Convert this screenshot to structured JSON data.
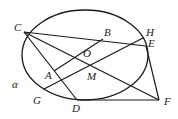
{
  "diagram": {
    "type": "geometry",
    "stroke_color": "#1a1a1a",
    "ellipse": {
      "cx": 85,
      "cy": 55,
      "rx": 63,
      "ry": 45,
      "plane_label": "α"
    },
    "points": {
      "C": {
        "x": 24,
        "y": 32,
        "label": "C",
        "lx": 14,
        "ly": 22
      },
      "B": {
        "x": 103,
        "y": 39,
        "label": "B",
        "lx": 104,
        "ly": 27
      },
      "H": {
        "x": 143,
        "y": 38,
        "label": "H",
        "lx": 146,
        "ly": 27
      },
      "E": {
        "x": 146,
        "y": 46,
        "label": "E",
        "lx": 148,
        "ly": 38
      },
      "O": {
        "x": 82,
        "y": 56,
        "label": "O",
        "lx": 83,
        "ly": 48
      },
      "A": {
        "x": 54,
        "y": 71,
        "label": "A",
        "lx": 45,
        "ly": 70
      },
      "M": {
        "x": 90,
        "y": 68,
        "label": "M",
        "lx": 87,
        "ly": 71
      },
      "G": {
        "x": 44,
        "y": 89,
        "label": "G",
        "lx": 33,
        "ly": 95
      },
      "D": {
        "x": 77,
        "y": 100,
        "label": "D",
        "lx": 72,
        "ly": 103
      },
      "F": {
        "x": 159,
        "y": 100,
        "label": "F",
        "lx": 164,
        "ly": 96
      },
      "alpha": {
        "label": "α",
        "lx": 12,
        "ly": 79
      }
    },
    "segments": [
      [
        "C",
        "E"
      ],
      [
        "C",
        "D"
      ],
      [
        "C",
        "F"
      ],
      [
        "E",
        "F"
      ],
      [
        "D",
        "F"
      ],
      [
        "A",
        "B"
      ],
      [
        "G",
        "H"
      ]
    ]
  }
}
